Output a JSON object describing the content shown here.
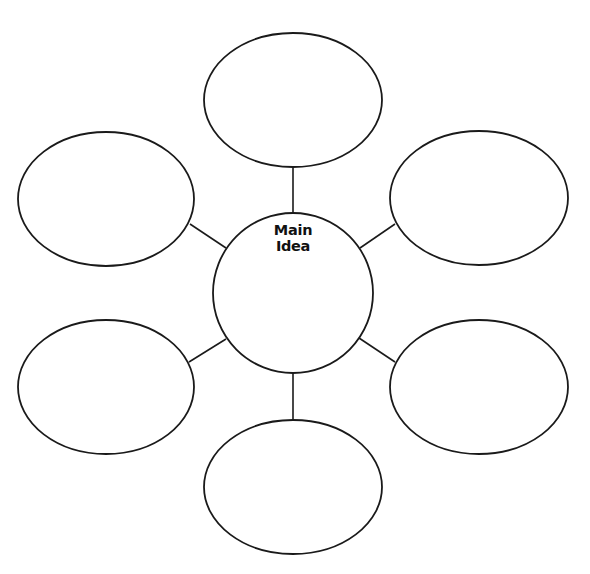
{
  "diagram": {
    "type": "bubble-map",
    "center": {
      "label_line1": "Main",
      "label_line2": "Idea",
      "cx": 293,
      "cy": 293,
      "r": 80
    },
    "bubbles": [
      {
        "position": "top",
        "cx": 293,
        "cy": 100,
        "rx": 89,
        "ry": 67,
        "text": ""
      },
      {
        "position": "upper-left",
        "cx": 106,
        "cy": 199,
        "rx": 88,
        "ry": 67,
        "text": ""
      },
      {
        "position": "upper-right",
        "cx": 479,
        "cy": 198,
        "rx": 89,
        "ry": 67,
        "text": ""
      },
      {
        "position": "lower-left",
        "cx": 106,
        "cy": 387,
        "rx": 88,
        "ry": 67,
        "text": ""
      },
      {
        "position": "lower-right",
        "cx": 479,
        "cy": 387,
        "rx": 89,
        "ry": 67,
        "text": ""
      },
      {
        "position": "bottom",
        "cx": 293,
        "cy": 487,
        "rx": 89,
        "ry": 67,
        "text": ""
      }
    ],
    "connectors": [
      {
        "to": "top",
        "x1": 293,
        "y1": 213,
        "x2": 293,
        "y2": 167
      },
      {
        "to": "upper-left",
        "x1": 226,
        "y1": 248,
        "x2": 190,
        "y2": 224
      },
      {
        "to": "upper-right",
        "x1": 360,
        "y1": 248,
        "x2": 395,
        "y2": 224
      },
      {
        "to": "lower-left",
        "x1": 226,
        "y1": 339,
        "x2": 189,
        "y2": 362
      },
      {
        "to": "lower-right",
        "x1": 359,
        "y1": 338,
        "x2": 395,
        "y2": 362
      },
      {
        "to": "bottom",
        "x1": 293,
        "y1": 373,
        "x2": 293,
        "y2": 420
      }
    ],
    "colors": {
      "stroke": "#1a1a1a",
      "fill": "#ffffff",
      "background": "#ffffff"
    }
  }
}
